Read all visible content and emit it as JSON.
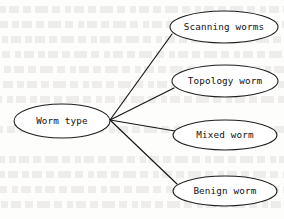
{
  "figure": {
    "type": "tree-diagram",
    "orientation": "left-to-right",
    "background_note": "faint scanned-page bleed-through text",
    "line_color": "#141414",
    "node_fill": "#ffffff",
    "node_stroke": "#1d1d1d",
    "text_color": "#121212",
    "root": {
      "label": "Worm type",
      "cx": 62,
      "cy": 121,
      "rx": 48,
      "ry": 17
    },
    "leaves": [
      {
        "label": "Scanning worms",
        "cx": 224,
        "cy": 27,
        "rx": 54,
        "ry": 16
      },
      {
        "label": "Topology worm",
        "cx": 225,
        "cy": 81,
        "rx": 53,
        "ry": 16
      },
      {
        "label": "Mixed worm",
        "cx": 225,
        "cy": 135,
        "rx": 52,
        "ry": 15
      },
      {
        "label": "Benign worm",
        "cx": 225,
        "cy": 191,
        "rx": 52,
        "ry": 15
      }
    ],
    "junction": {
      "x": 110,
      "y": 120
    },
    "edges": [
      {
        "from": "Worm type",
        "to": "Scanning worms",
        "x1": 110,
        "y1": 120,
        "x2": 172,
        "y2": 34
      },
      {
        "from": "Worm type",
        "to": "Topology worm",
        "x1": 110,
        "y1": 120,
        "x2": 174,
        "y2": 88
      },
      {
        "from": "Worm type",
        "to": "Mixed worm",
        "x1": 110,
        "y1": 120,
        "x2": 175,
        "y2": 131
      },
      {
        "from": "Worm type",
        "to": "Benign worm",
        "x1": 110,
        "y1": 120,
        "x2": 177,
        "y2": 184
      }
    ]
  },
  "ghost_rows": [
    {
      "top": 6
    },
    {
      "top": 21
    },
    {
      "top": 36
    },
    {
      "top": 51
    },
    {
      "top": 66
    },
    {
      "top": 81
    },
    {
      "top": 96
    },
    {
      "top": 126
    },
    {
      "top": 156
    },
    {
      "top": 171
    },
    {
      "top": 186
    },
    {
      "top": 201
    }
  ]
}
